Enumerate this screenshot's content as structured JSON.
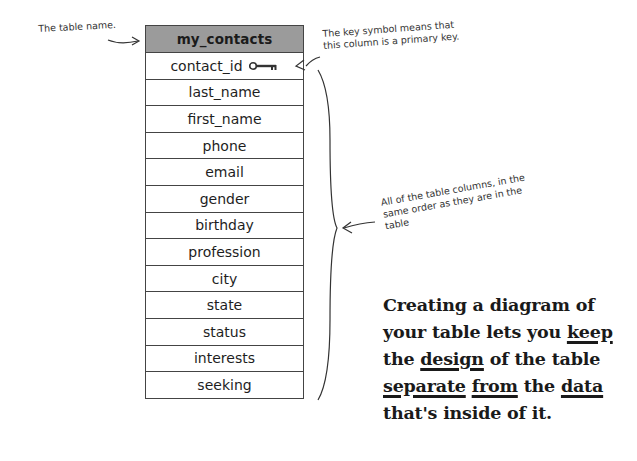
{
  "annotations": {
    "table_name": "The table name.",
    "key_symbol": "The key symbol means that this column is a primary key.",
    "all_columns": "All of the table columns, in the same order as they are in the table"
  },
  "table": {
    "name": "my_contacts",
    "header_color": "#9b9b9b",
    "primary_key_icon": "key-icon",
    "columns": [
      {
        "name": "contact_id",
        "primary_key": true
      },
      {
        "name": "last_name"
      },
      {
        "name": "first_name"
      },
      {
        "name": "phone"
      },
      {
        "name": "email"
      },
      {
        "name": "gender"
      },
      {
        "name": "birthday"
      },
      {
        "name": "profession"
      },
      {
        "name": "city"
      },
      {
        "name": "state"
      },
      {
        "name": "status"
      },
      {
        "name": "interests"
      },
      {
        "name": "seeking"
      }
    ]
  },
  "callout": {
    "parts": [
      {
        "text": "Creating a diagram of your table lets you ",
        "u": false
      },
      {
        "text": "keep",
        "u": true
      },
      {
        "text": " the ",
        "u": false
      },
      {
        "text": "design",
        "u": true
      },
      {
        "text": " of the table ",
        "u": false
      },
      {
        "text": "separate",
        "u": true
      },
      {
        "text": " ",
        "u": false
      },
      {
        "text": "from",
        "u": true
      },
      {
        "text": " the ",
        "u": false
      },
      {
        "text": "data",
        "u": true
      },
      {
        "text": " that's inside of it.",
        "u": false
      }
    ]
  }
}
